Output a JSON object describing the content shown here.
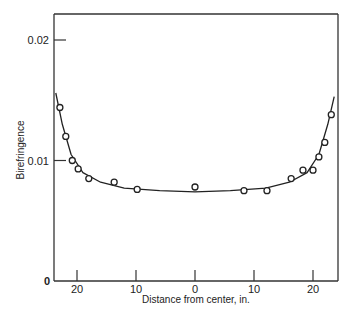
{
  "chart_data": {
    "type": "scatter",
    "title": "",
    "xlabel": "Distance from center, in.",
    "ylabel": "Birefringence",
    "x_tick_labels": [
      "20",
      "10",
      "0",
      "10",
      "20"
    ],
    "x_ticks": [
      -20,
      -10,
      0,
      10,
      20
    ],
    "y_tick_labels": [
      "0",
      "0.01",
      "0.02"
    ],
    "y_ticks": [
      0,
      0.01,
      0.02
    ],
    "xlim": [
      -24,
      24
    ],
    "ylim": [
      0,
      0.022
    ],
    "grid": false,
    "legend": null,
    "series": [
      {
        "name": "measured",
        "marker": "open-circle",
        "points": [
          {
            "x": -22.9,
            "y": 0.0144
          },
          {
            "x": -21.9,
            "y": 0.012
          },
          {
            "x": -20.8,
            "y": 0.01
          },
          {
            "x": -19.8,
            "y": 0.0093
          },
          {
            "x": -18.0,
            "y": 0.0085
          },
          {
            "x": -13.7,
            "y": 0.0082
          },
          {
            "x": -9.8,
            "y": 0.0076
          },
          {
            "x": 0.0,
            "y": 0.0078
          },
          {
            "x": 8.3,
            "y": 0.0075
          },
          {
            "x": 12.2,
            "y": 0.0075
          },
          {
            "x": 16.3,
            "y": 0.0085
          },
          {
            "x": 18.3,
            "y": 0.0092
          },
          {
            "x": 20.0,
            "y": 0.0092
          },
          {
            "x": 21.0,
            "y": 0.0103
          },
          {
            "x": 22.0,
            "y": 0.0115
          },
          {
            "x": 23.1,
            "y": 0.0138
          }
        ]
      },
      {
        "name": "fitted curve",
        "marker": "line",
        "points": [
          {
            "x": -23.6,
            "y": 0.0156
          },
          {
            "x": -22.5,
            "y": 0.013
          },
          {
            "x": -21.0,
            "y": 0.0105
          },
          {
            "x": -19.0,
            "y": 0.009
          },
          {
            "x": -16.0,
            "y": 0.0082
          },
          {
            "x": -12.0,
            "y": 0.0077
          },
          {
            "x": -6.0,
            "y": 0.0075
          },
          {
            "x": 0.0,
            "y": 0.0074
          },
          {
            "x": 6.0,
            "y": 0.0075
          },
          {
            "x": 12.0,
            "y": 0.0077
          },
          {
            "x": 16.0,
            "y": 0.0082
          },
          {
            "x": 19.0,
            "y": 0.009
          },
          {
            "x": 21.0,
            "y": 0.0105
          },
          {
            "x": 22.5,
            "y": 0.013
          },
          {
            "x": 23.6,
            "y": 0.0153
          }
        ]
      }
    ]
  }
}
